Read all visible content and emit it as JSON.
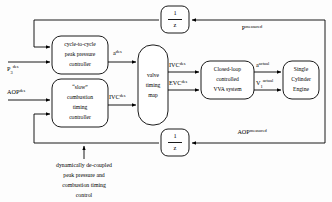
{
  "diagram": {
    "blocks": {
      "peak_pressure_controller": {
        "line1": "cycle-to-cycle",
        "line2": "peak pressure",
        "line3": "controller"
      },
      "combustion_timing_controller": {
        "line1": "“slow”",
        "line2": "combustion",
        "line3": "timing",
        "line4": "controller"
      },
      "valve_timing_map": {
        "line1": "valve",
        "line2": "timing",
        "line3": "map"
      },
      "vva_system": {
        "line1": "Closed-loop",
        "line2": "controlled",
        "line3": "VVA system"
      },
      "engine": {
        "line1": "Single",
        "line2": "Cylinder",
        "line3": "Engine"
      },
      "delay_top": {
        "numerator": "1",
        "denominator": "z"
      },
      "delay_bottom": {
        "numerator": "1",
        "denominator": "z"
      }
    },
    "signals": {
      "p3_des": {
        "base": "P",
        "sub": "3",
        "sup": "des"
      },
      "aop_des": {
        "base": "AOP",
        "sup": "des"
      },
      "a_des": {
        "base": "a",
        "sup": "des"
      },
      "ivc_des_map_in": {
        "base": "IVC",
        "sup": "des"
      },
      "ivc_des_map_out": {
        "base": "IVC",
        "sup": "des"
      },
      "evc_des_map_out": {
        "base": "EVC",
        "sup": "des"
      },
      "a_actual": {
        "base": "a",
        "sup": "actual"
      },
      "v1_actual": {
        "base": "V",
        "sub": "1",
        "sup": "actual"
      },
      "p_measured": {
        "base": "P",
        "sup": "measured"
      },
      "aop_measured": {
        "base": "AOP",
        "sup": "measured"
      }
    },
    "caption": {
      "line1": "dynamically de-coupled",
      "line2": "peak pressure and",
      "line3": "combustion timing",
      "line4": "control"
    },
    "colors": {
      "stroke": "#000000",
      "fill": "#ffffff",
      "background": "#fdfdfd"
    }
  }
}
